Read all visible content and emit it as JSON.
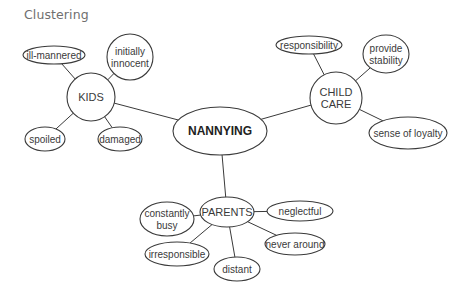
{
  "title": "Clustering",
  "center": {
    "label": "NANNYING",
    "cx": 220,
    "cy": 131,
    "rx": 47,
    "ry": 24
  },
  "hubs": [
    {
      "id": "kids",
      "lines": [
        "KIDS"
      ],
      "cx": 91,
      "cy": 97,
      "rx": 24,
      "ry": 24
    },
    {
      "id": "child-care",
      "lines": [
        "CHILD",
        "CARE"
      ],
      "cx": 336,
      "cy": 98,
      "rx": 26,
      "ry": 26
    },
    {
      "id": "parents",
      "lines": [
        "PARENTS"
      ],
      "cx": 227,
      "cy": 212,
      "rx": 27,
      "ry": 15
    }
  ],
  "leaves": [
    {
      "id": "ill-mannered",
      "hub": "kids",
      "lines": [
        "ill-mannered"
      ],
      "cx": 54,
      "cy": 55,
      "rx": 31,
      "ry": 9
    },
    {
      "id": "initially-innocent",
      "hub": "kids",
      "lines": [
        "initially",
        "innocent"
      ],
      "cx": 130,
      "cy": 57,
      "rx": 23,
      "ry": 23
    },
    {
      "id": "spoiled",
      "hub": "kids",
      "lines": [
        "spoiled"
      ],
      "cx": 45,
      "cy": 139,
      "rx": 20,
      "ry": 12
    },
    {
      "id": "damaged",
      "hub": "kids",
      "lines": [
        "damaged"
      ],
      "cx": 120,
      "cy": 139,
      "rx": 22,
      "ry": 12
    },
    {
      "id": "responsibility",
      "hub": "child-care",
      "lines": [
        "responsibility"
      ],
      "cx": 309,
      "cy": 45,
      "rx": 33,
      "ry": 9
    },
    {
      "id": "provide-stability",
      "hub": "child-care",
      "lines": [
        "provide",
        "stability"
      ],
      "cx": 386,
      "cy": 54,
      "rx": 23,
      "ry": 19
    },
    {
      "id": "sense-of-loyalty",
      "hub": "child-care",
      "lines": [
        "sense of loyalty"
      ],
      "cx": 408,
      "cy": 133,
      "rx": 39,
      "ry": 16
    },
    {
      "id": "constantly-busy",
      "hub": "parents",
      "lines": [
        "constantly",
        "busy"
      ],
      "cx": 167,
      "cy": 219,
      "rx": 27,
      "ry": 17
    },
    {
      "id": "neglectful",
      "hub": "parents",
      "lines": [
        "neglectful"
      ],
      "cx": 300,
      "cy": 211,
      "rx": 33,
      "ry": 10
    },
    {
      "id": "never-around",
      "hub": "parents",
      "lines": [
        "never around"
      ],
      "cx": 295,
      "cy": 244,
      "rx": 30,
      "ry": 11
    },
    {
      "id": "irresponsible",
      "hub": "parents",
      "lines": [
        "irresponsible"
      ],
      "cx": 177,
      "cy": 254,
      "rx": 32,
      "ry": 12
    },
    {
      "id": "distant",
      "hub": "parents",
      "lines": [
        "distant"
      ],
      "cx": 237,
      "cy": 269,
      "rx": 23,
      "ry": 12
    }
  ],
  "edges": [
    [
      "center",
      "kids"
    ],
    [
      "center",
      "child-care"
    ],
    [
      "center",
      "parents"
    ],
    [
      "kids",
      "ill-mannered"
    ],
    [
      "kids",
      "initially-innocent"
    ],
    [
      "kids",
      "spoiled"
    ],
    [
      "kids",
      "damaged"
    ],
    [
      "child-care",
      "responsibility"
    ],
    [
      "child-care",
      "provide-stability"
    ],
    [
      "child-care",
      "sense-of-loyalty"
    ],
    [
      "parents",
      "constantly-busy"
    ],
    [
      "parents",
      "neglectful"
    ],
    [
      "parents",
      "never-around"
    ],
    [
      "parents",
      "irresponsible"
    ],
    [
      "parents",
      "distant"
    ]
  ],
  "colors": {
    "stroke": "#3a3a3a",
    "title": "#6f6f6f",
    "background": "#ffffff"
  }
}
